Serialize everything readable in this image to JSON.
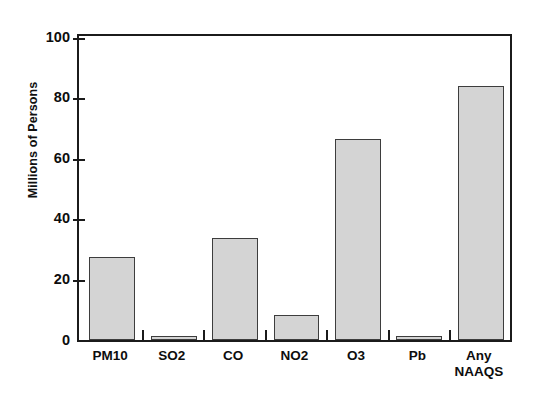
{
  "chart_data": {
    "type": "bar",
    "title": "",
    "xlabel": "",
    "ylabel": "Millions of Persons",
    "categories": [
      "PM10",
      "SO2",
      "CO",
      "NO2",
      "O3",
      "Pb",
      "Any\nNAAQS"
    ],
    "values": [
      27.4,
      0.9,
      33.6,
      8.1,
      66.2,
      1.0,
      83.8
    ],
    "ylim": [
      0,
      100
    ],
    "yticks": [
      0,
      20,
      40,
      60,
      80,
      100
    ],
    "ytick_labels": [
      "0",
      "20",
      "40",
      "60",
      "80",
      "100"
    ],
    "grid": false,
    "legend": "none",
    "bar_fill_color": "#d4d4d4",
    "bar_edge_color": "#3d3d3d",
    "axis_color": "#1b1b1b",
    "background_color": "#ffffff"
  },
  "axes": {
    "y_title": "Millions of Persons"
  }
}
